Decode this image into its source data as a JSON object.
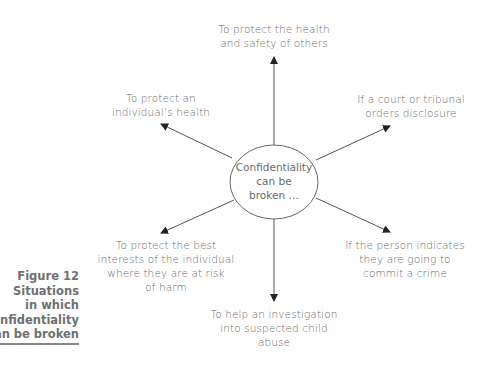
{
  "figure": {
    "number_label": "Figure 12",
    "caption_lines": [
      "Situations",
      "in which",
      "confidentiality",
      "can be broken"
    ]
  },
  "center": {
    "lines": [
      "Confidentiality",
      "can be",
      "broken …"
    ]
  },
  "situations": [
    {
      "position": "top",
      "lines": [
        "To protect the health",
        "and safety of others"
      ]
    },
    {
      "position": "upper-left",
      "lines": [
        "To protect an",
        "individual’s health"
      ]
    },
    {
      "position": "upper-right",
      "lines": [
        "If a court or tribunal",
        "orders disclosure"
      ]
    },
    {
      "position": "lower-left",
      "lines": [
        "To protect the best",
        "interests of the individual",
        "where they are at risk",
        "of harm"
      ]
    },
    {
      "position": "lower-right",
      "lines": [
        "If the person indicates",
        "they are going to",
        "commit a crime"
      ]
    },
    {
      "position": "bottom",
      "lines": [
        "To help an investigation",
        "into suspected child",
        "abuse"
      ]
    }
  ],
  "colors": {
    "text": "#6b6b6b",
    "lines": "#555555",
    "caption": "#707070"
  }
}
